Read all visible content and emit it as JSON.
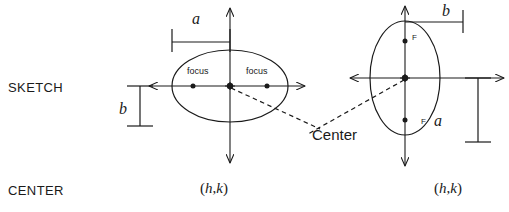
{
  "figure": {
    "background_color": "#ffffff",
    "stroke_color": "#1a1a1a",
    "text_color": "#1a1a1a"
  },
  "row_labels": {
    "sketch": "SKETCH",
    "center": "CENTER"
  },
  "left_diagram": {
    "name": "horizontal-ellipse",
    "focus_left_label": "focus",
    "focus_right_label": "focus",
    "semi_major_label": "a",
    "semi_minor_label": "b",
    "center_value": "(h,k )",
    "center_open_paren": "(",
    "center_h": "h",
    "center_comma": ",",
    "center_k": "k",
    "center_close_paren": ")"
  },
  "right_diagram": {
    "name": "vertical-ellipse",
    "focus_upper_label": "F",
    "focus_lower_label": "F",
    "semi_major_label": "a",
    "semi_minor_label": "b",
    "center_value": "(h,k )",
    "center_open_paren": "(",
    "center_h": "h",
    "center_comma": ",",
    "center_k": "k",
    "center_close_paren": ")"
  },
  "annotations": {
    "center_callout": "Center"
  }
}
